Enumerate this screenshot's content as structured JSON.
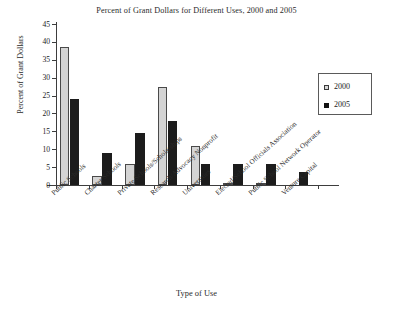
{
  "chart_data": {
    "type": "bar",
    "title": "Percent of Grant Dollars for Different Uses, 2000 and 2005",
    "xlabel": "Type of Use",
    "ylabel": "Percent of Grant Dollars",
    "ylim": [
      0,
      45
    ],
    "yticks": [
      0,
      5,
      10,
      15,
      20,
      25,
      30,
      35,
      40,
      45
    ],
    "grid": false,
    "legend_position": "right",
    "categories": [
      "Public Schools",
      "Charter Schools",
      "Private Schools/Scholarships",
      "Research/Advocacy Nonprofit",
      "Universities",
      "Elected/School Officials Association",
      "Public School Network Operator",
      "Venture Capital"
    ],
    "series": [
      {
        "name": "2000",
        "color": "#d4d4d4",
        "values": [
          38.5,
          2.5,
          6.0,
          27.5,
          11.0,
          0.3,
          0.3,
          0.0
        ]
      },
      {
        "name": "2005",
        "color": "#1c1c1c",
        "values": [
          24.0,
          9.0,
          14.5,
          18.0,
          6.0,
          6.0,
          6.0,
          3.5
        ]
      }
    ]
  },
  "legend": {
    "items": [
      {
        "label": "2000"
      },
      {
        "label": "2005"
      }
    ]
  }
}
